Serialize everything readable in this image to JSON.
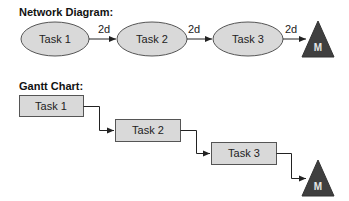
{
  "network": {
    "title": "Network Diagram:",
    "tasks": [
      {
        "label": "Task 1"
      },
      {
        "label": "Task 2"
      },
      {
        "label": "Task 3"
      }
    ],
    "lags": [
      "2d",
      "2d",
      "2d"
    ],
    "milestone": "M"
  },
  "gantt": {
    "title": "Gantt Chart:",
    "tasks": [
      {
        "label": "Task 1"
      },
      {
        "label": "Task 2"
      },
      {
        "label": "Task 3"
      }
    ],
    "milestone": "M"
  },
  "colors": {
    "node_fill": "#d9d9d9",
    "stroke": "#444444",
    "milestone_fill": "#3f3f3f"
  }
}
